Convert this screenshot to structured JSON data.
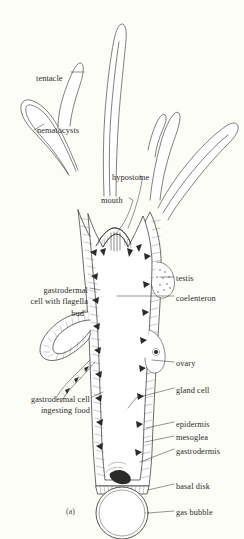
{
  "figure": {
    "organism": "hydra",
    "view": "longitudinal section",
    "caption": "(a)",
    "background_color": "#fdfdf8",
    "ink_color": "#2b2b28"
  },
  "labels": [
    {
      "id": "tentacle",
      "text": "tentacle",
      "x": 36,
      "y": 73,
      "align": "left"
    },
    {
      "id": "nematocysts",
      "text": "nematocysts",
      "x": 37,
      "y": 125,
      "align": "left"
    },
    {
      "id": "hypostome",
      "text": "hypostome",
      "x": 112,
      "y": 172,
      "align": "left"
    },
    {
      "id": "mouth",
      "text": "mouth",
      "x": 101,
      "y": 195,
      "align": "left"
    },
    {
      "id": "testis",
      "text": "testis",
      "x": 176,
      "y": 273,
      "align": "left"
    },
    {
      "id": "coelenteron",
      "text": "coelenteron",
      "x": 176,
      "y": 293,
      "align": "left"
    },
    {
      "id": "ovary",
      "text": "ovary",
      "x": 176,
      "y": 358,
      "align": "left"
    },
    {
      "id": "gland-cell",
      "text": "gland cell",
      "x": 176,
      "y": 385,
      "align": "left"
    },
    {
      "id": "epidermis",
      "text": "epidermis",
      "x": 176,
      "y": 419,
      "align": "left"
    },
    {
      "id": "mesoglea",
      "text": "mesoglea",
      "x": 176,
      "y": 432,
      "align": "left"
    },
    {
      "id": "gastrodermis",
      "text": "gastrodermis",
      "x": 176,
      "y": 446,
      "align": "left"
    },
    {
      "id": "basal-disk",
      "text": "basal disk",
      "x": 176,
      "y": 481,
      "align": "left"
    },
    {
      "id": "gas-bubble",
      "text": "gas bubble",
      "x": 176,
      "y": 507,
      "align": "left"
    },
    {
      "id": "bud",
      "text": "bud",
      "x": 84,
      "y": 308,
      "align": "right"
    }
  ],
  "multiline_labels": [
    {
      "id": "gastrodermal-cell-with-flagella",
      "lines": [
        "gastrodermal",
        "cell with flagella"
      ],
      "x": 88,
      "y": 285,
      "align": "right"
    },
    {
      "id": "gastrodermal-cell-ingesting-food",
      "lines": [
        "gastrodermal cell",
        "ingesting food"
      ],
      "x": 90,
      "y": 394,
      "align": "right"
    }
  ],
  "structures": {
    "tentacles_count": 5,
    "hypostome": "conical oral cone",
    "body_column": "two-layered wall: epidermis, mesoglea, gastrodermis",
    "bud": "lateral outgrowth on left side",
    "gonads": [
      "testis",
      "ovary"
    ],
    "base": "basal disk with attached gas bubble"
  }
}
